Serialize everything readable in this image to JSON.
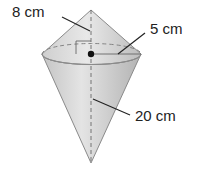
{
  "figure": {
    "type": "composite solid: cone on top of cone (shared circular base)",
    "labels": {
      "top_cone_measure": "8 cm",
      "radius": "5 cm",
      "bottom_cone_height": "20 cm"
    },
    "colors": {
      "fill_light": "#e6e6e6",
      "fill_dark": "#b9b9b9",
      "outline": "#8a8a8a",
      "leader": "#222222",
      "center_dot": "#111111"
    }
  }
}
